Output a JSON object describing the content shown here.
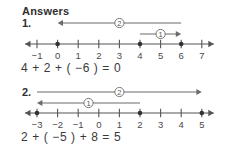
{
  "heading": {
    "title": "Answers"
  },
  "style": {
    "line_color": "#555555",
    "arc_color": "#6b6b6b",
    "text_color": "#3a3a3a",
    "background": "#ffffff"
  },
  "problems": [
    {
      "number": "1.",
      "equation": "4 + 2 + ( −6 ) = 0",
      "number_line": {
        "ticks": [
          "−1",
          "0",
          "1",
          "2",
          "3",
          "4",
          "5",
          "6",
          "7"
        ],
        "tick_values": [
          -1,
          0,
          1,
          2,
          3,
          4,
          5,
          6,
          7
        ],
        "min": -1,
        "max": 7,
        "points": [
          0,
          4,
          6
        ],
        "left_arrow": true,
        "right_arrow": true
      },
      "jumps": [
        {
          "label": "1",
          "from": 4,
          "to": 6,
          "direction": "right",
          "value": 2,
          "row": 1
        },
        {
          "label": "2",
          "from": 6,
          "to": 0,
          "direction": "left",
          "value": -6,
          "row": 0
        }
      ]
    },
    {
      "number": "2.",
      "equation": "2 + ( −5 ) + 8 = 5",
      "number_line": {
        "ticks": [
          "−3",
          "−2",
          "−1",
          "0",
          "1",
          "2",
          "3",
          "4",
          "5"
        ],
        "tick_values": [
          -3,
          -2,
          -1,
          0,
          1,
          2,
          3,
          4,
          5
        ],
        "min": -3,
        "max": 5,
        "points": [
          -3,
          2,
          5
        ],
        "left_arrow": true,
        "right_arrow": true
      },
      "jumps": [
        {
          "label": "2",
          "from": -3,
          "to": 5,
          "direction": "right",
          "value": 8,
          "row": 0
        },
        {
          "label": "1",
          "from": 2,
          "to": -3,
          "direction": "left",
          "value": -5,
          "row": 1
        }
      ]
    }
  ]
}
